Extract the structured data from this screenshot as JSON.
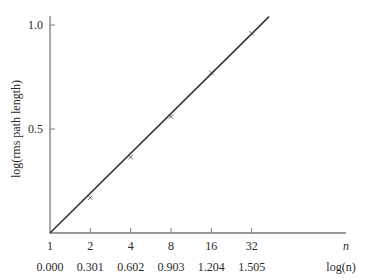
{
  "chart_data": {
    "type": "line",
    "title": "",
    "xlabel": "log(n)",
    "xlabel_secondary": "n",
    "ylabel": "log(rms path length)",
    "x_n_ticks": [
      "1",
      "2",
      "4",
      "8",
      "16",
      "32"
    ],
    "x_log_ticks": [
      "0.000",
      "0.301",
      "0.602",
      "0.903",
      "1.204",
      "1.505"
    ],
    "y_ticks": [
      "0.5",
      "1.0"
    ],
    "xlim": [
      0,
      1.75
    ],
    "ylim": [
      0,
      1.05
    ],
    "grid": false,
    "series": [
      {
        "name": "data points",
        "marker": "x",
        "x": [
          0.301,
          0.602,
          0.903,
          1.204,
          1.505
        ],
        "values": [
          0.17,
          0.365,
          0.56,
          0.77,
          0.96
        ]
      },
      {
        "name": "fit line",
        "style": "solid",
        "x": [
          0.0,
          1.635
        ],
        "values": [
          0.0,
          1.04
        ]
      }
    ]
  },
  "colors": {
    "axis": "#7a7a7a",
    "line": "#333333",
    "marker": "#555555",
    "text": "#2a2a2a"
  }
}
